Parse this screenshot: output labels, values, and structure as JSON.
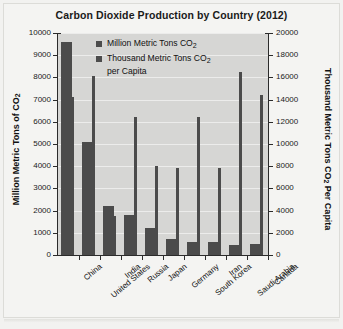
{
  "chart_data": {
    "type": "bar",
    "title": "Carbon Dioxide Production by Country (2012)",
    "xlabel": "",
    "ylabel": "Million Metric Tons of CO2",
    "ylabel_right": "Thousand Metric Tons CO2 Per Capita",
    "categories": [
      "China",
      "United States",
      "India",
      "Russia",
      "Japan",
      "Germany",
      "South Korea",
      "Iran",
      "Saudi Arabia",
      "Canada"
    ],
    "series": [
      {
        "name": "Million Metric Tons CO2",
        "axis": "left",
        "values": [
          9600,
          5100,
          2200,
          1800,
          1200,
          700,
          600,
          600,
          450,
          500
        ]
      },
      {
        "name": "Thousand Metric Tons CO2 per Capita",
        "axis": "right",
        "values": [
          14200,
          16100,
          3500,
          12400,
          8000,
          7800,
          12400,
          7800,
          16500,
          14400
        ]
      }
    ],
    "ylim": [
      0,
      10000
    ],
    "ylim_right": [
      0,
      20000
    ],
    "yticks": [
      0,
      1000,
      2000,
      3000,
      4000,
      5000,
      6000,
      7000,
      8000,
      9000,
      10000
    ],
    "yticks_right": [
      0,
      2000,
      4000,
      6000,
      8000,
      10000,
      12000,
      14000,
      16000,
      18000,
      20000
    ],
    "grid": true,
    "legend_position": "top-center",
    "colors": {
      "bar": "#4b4b4b",
      "plot_background": "#d6d6d4",
      "page_background": "#f4f4f2",
      "grid": "#ececeb",
      "axis": "#2b2b2b",
      "text": "#111111"
    }
  },
  "legend": {
    "entries": [
      {
        "label": "Million Metric Tons CO2"
      },
      {
        "label": "Thousand Metric Tons CO2\nper Capita"
      }
    ]
  }
}
